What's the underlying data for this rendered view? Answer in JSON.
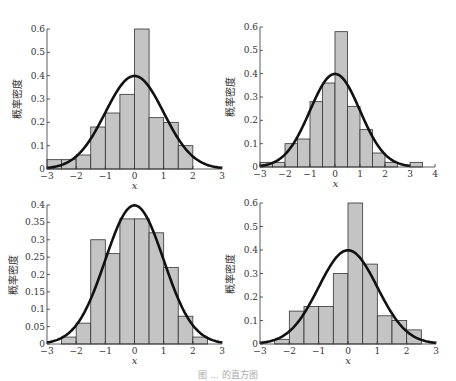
{
  "figure": {
    "top_clipped_text": "",
    "caption": "图 ... 的直方图"
  },
  "chart_data": [
    {
      "type": "bar",
      "panel": "top-left",
      "title": "",
      "xlabel": "x",
      "ylabel": "概率密度",
      "xlim": [
        -3,
        3
      ],
      "ylim": [
        0,
        0.6
      ],
      "xticks": [
        "−3",
        "−2",
        "−1",
        "0",
        "1",
        "2",
        "3"
      ],
      "xtick_values": [
        -3,
        -2,
        -1,
        0,
        1,
        2,
        3
      ],
      "yticks": [
        "0",
        "0.1",
        "0.2",
        "0.3",
        "0.4",
        "0.5",
        "0.6"
      ],
      "ytick_values": [
        0,
        0.1,
        0.2,
        0.3,
        0.4,
        0.5,
        0.6
      ],
      "bin_edges": [
        -3,
        -2.5,
        -2,
        -1.5,
        -1,
        -0.5,
        0,
        0.5,
        1,
        1.5,
        2
      ],
      "values": [
        0.04,
        0.04,
        0.06,
        0.18,
        0.24,
        0.32,
        0.6,
        0.22,
        0.2,
        0.1
      ],
      "overlay": "standard normal pdf (peak 0.4 at x=0)",
      "grid": false,
      "frame": {
        "x0": 47,
        "x1": 222,
        "y0": 169,
        "y1": 29
      }
    },
    {
      "type": "bar",
      "panel": "top-right",
      "title": "",
      "xlabel": "x",
      "ylabel": "概率密度",
      "xlim": [
        -3,
        4
      ],
      "ylim": [
        0,
        0.6
      ],
      "xticks": [
        "−3",
        "−2",
        "−1",
        "0",
        "1",
        "2",
        "3",
        "4"
      ],
      "xtick_values": [
        -3,
        -2,
        -1,
        0,
        1,
        2,
        3,
        4
      ],
      "yticks": [
        "0",
        "0.1",
        "0.2",
        "0.3",
        "0.4",
        "0.5",
        "0.6"
      ],
      "ytick_values": [
        0,
        0.1,
        0.2,
        0.3,
        0.4,
        0.5,
        0.6
      ],
      "bin_edges": [
        -3,
        -2.5,
        -2,
        -1.5,
        -1,
        -0.5,
        0,
        0.5,
        1,
        1.5,
        2,
        2.5,
        3,
        3.5
      ],
      "values": [
        0.02,
        0.02,
        0.1,
        0.12,
        0.28,
        0.36,
        0.58,
        0.26,
        0.16,
        0.06,
        0.02,
        0.0,
        0.02
      ],
      "overlay": "standard normal pdf (peak 0.4 at x=0)",
      "grid": false,
      "frame": {
        "x0": 260,
        "x1": 435,
        "y0": 167,
        "y1": 27
      }
    },
    {
      "type": "bar",
      "panel": "bottom-left",
      "title": "",
      "xlabel": "x",
      "ylabel": "概率密度",
      "xlim": [
        -3,
        3
      ],
      "ylim": [
        0,
        0.4
      ],
      "xticks": [
        "−3",
        "−2",
        "−1",
        "0",
        "1",
        "2",
        "3"
      ],
      "xtick_values": [
        -3,
        -2,
        -1,
        0,
        1,
        2,
        3
      ],
      "yticks": [
        "0",
        "0.05",
        "0.1",
        "0.15",
        "0.2",
        "0.25",
        "0.3",
        "0.35",
        "0.4"
      ],
      "ytick_values": [
        0,
        0.05,
        0.1,
        0.15,
        0.2,
        0.25,
        0.3,
        0.35,
        0.4
      ],
      "bin_edges": [
        -2.5,
        -2,
        -1.5,
        -1,
        -0.5,
        0,
        0.5,
        1,
        1.5,
        2,
        2.5
      ],
      "values": [
        0.02,
        0.06,
        0.3,
        0.26,
        0.36,
        0.36,
        0.32,
        0.22,
        0.08,
        0.02
      ],
      "overlay": "standard normal pdf (peak 0.4 at x=0)",
      "grid": false,
      "frame": {
        "x0": 47,
        "x1": 222,
        "y0": 344,
        "y1": 205
      }
    },
    {
      "type": "bar",
      "panel": "bottom-right",
      "title": "",
      "xlabel": "x",
      "ylabel": "概率密度",
      "xlim": [
        -3,
        3
      ],
      "ylim": [
        0,
        0.6
      ],
      "xticks": [
        "−3",
        "−2",
        "−1",
        "0",
        "1",
        "2",
        "3"
      ],
      "xtick_values": [
        -3,
        -2,
        -1,
        0,
        1,
        2,
        3
      ],
      "yticks": [
        "0",
        "0.1",
        "0.2",
        "0.3",
        "0.4",
        "0.5",
        "0.6"
      ],
      "ytick_values": [
        0,
        0.1,
        0.2,
        0.3,
        0.4,
        0.5,
        0.6
      ],
      "bin_edges": [
        -2.5,
        -2,
        -1.5,
        -1,
        -0.5,
        0,
        0.5,
        1,
        1.5,
        2,
        2.5
      ],
      "values": [
        0.02,
        0.14,
        0.16,
        0.16,
        0.3,
        0.6,
        0.34,
        0.12,
        0.1,
        0.06
      ],
      "overlay": "standard normal pdf (peak 0.4 at x=0)",
      "grid": false,
      "frame": {
        "x0": 260,
        "x1": 436,
        "y0": 344,
        "y1": 203
      }
    }
  ],
  "style": {
    "bar_fill": "#c4c4c4",
    "bar_stroke": "#333333",
    "curve_color": "#111111",
    "axis_color": "#333333",
    "text_color": "#333333"
  }
}
